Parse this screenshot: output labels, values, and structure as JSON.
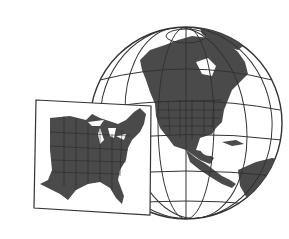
{
  "illustration": {
    "alt": "Globe centered on North America with an inset map of the eastern United States",
    "globe": {
      "subject": "North America",
      "land_color": "#4a4a4a",
      "ocean_color": "#ffffff",
      "grid_color": "#333333"
    },
    "inset": {
      "subject": "Eastern United States",
      "land_color": "#4a4a4a",
      "frame_color": "#333333"
    }
  }
}
